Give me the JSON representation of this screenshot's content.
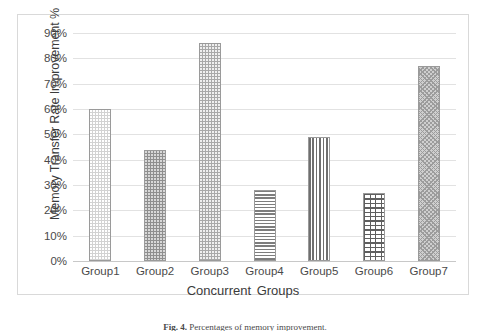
{
  "chart_data": {
    "type": "bar",
    "title": "",
    "xlabel": "Concurrent  Groups",
    "ylabel": "Memory Transfer Rate Improvement %",
    "categories": [
      "Group1",
      "Group2",
      "Group3",
      "Group4",
      "Group5",
      "Group6",
      "Group7"
    ],
    "values": [
      60,
      44,
      86,
      28,
      49,
      27,
      77
    ],
    "ylim": [
      0,
      90
    ],
    "ytick_labels": [
      "90%",
      "80%",
      "70%",
      "60%",
      "50%",
      "40%",
      "30%",
      "20%",
      "10%",
      "0%"
    ],
    "ytick_values": [
      90,
      80,
      70,
      60,
      50,
      40,
      30,
      20,
      10,
      0
    ],
    "grid": true,
    "legend": "none",
    "bar_patterns": [
      "dots-light",
      "dots-dark",
      "dots-medium",
      "horizontal-lines",
      "vertical-lines",
      "brick",
      "diagonal-crosshatch"
    ],
    "colors": {
      "gridline": "#e2e2e2",
      "axis": "#c8c8c8",
      "frame_border": "#d9d9d9",
      "bar_outline": "#9a9a9a",
      "text": "#3b3b3b",
      "tick_text": "#4a4a4a",
      "background": "#ffffff"
    }
  },
  "caption": {
    "label": "Fig. 4.",
    "text": "Percentages of memory improvement."
  }
}
